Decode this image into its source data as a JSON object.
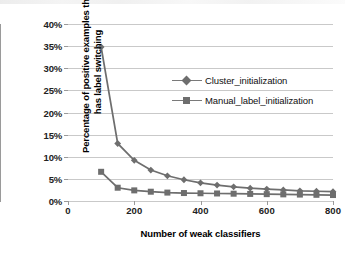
{
  "chart_data": {
    "type": "line",
    "title": "",
    "xlabel": "Number of weak classifiers",
    "ylabel": "Percentage of positive examples that has label switching",
    "xlim": [
      0,
      800
    ],
    "ylim": [
      0,
      40
    ],
    "xticks": [
      0,
      200,
      400,
      600,
      800
    ],
    "xtick_labels": [
      "0",
      "200",
      "400",
      "600",
      "800"
    ],
    "yticks": [
      0,
      5,
      10,
      15,
      20,
      25,
      30,
      35,
      40
    ],
    "ytick_labels": [
      "0%",
      "5%",
      "10%",
      "15%",
      "20%",
      "25%",
      "30%",
      "35%",
      "40%"
    ],
    "grid": "horizontal",
    "legend_position": "upper-center-right",
    "series": [
      {
        "name": "Cluster_initialization",
        "marker": "diamond",
        "color": "#6e6e6e",
        "x": [
          100,
          150,
          200,
          250,
          300,
          350,
          400,
          450,
          500,
          550,
          600,
          650,
          700,
          750,
          800
        ],
        "values": [
          34.8,
          13.0,
          9.2,
          7.0,
          5.7,
          4.8,
          4.1,
          3.6,
          3.2,
          2.9,
          2.7,
          2.5,
          2.3,
          2.2,
          2.1
        ]
      },
      {
        "name": "Manual_label_initialization",
        "marker": "square",
        "color": "#6e6e6e",
        "x": [
          100,
          150,
          200,
          250,
          300,
          350,
          400,
          450,
          500,
          550,
          600,
          650,
          700,
          750,
          800
        ],
        "values": [
          6.6,
          3.0,
          2.4,
          2.1,
          1.9,
          1.8,
          1.75,
          1.7,
          1.65,
          1.6,
          1.55,
          1.5,
          1.45,
          1.4,
          1.35
        ]
      }
    ]
  },
  "legend": {
    "items": [
      {
        "label": "Cluster_initialization"
      },
      {
        "label": "Manual_label_initialization"
      }
    ]
  },
  "colors": {
    "series": "#6e6e6e",
    "gridline": "#c9c9c9",
    "axis": "#9a9a9a"
  }
}
